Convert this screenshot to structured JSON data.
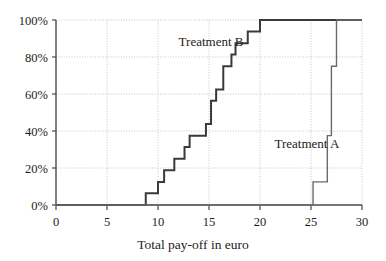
{
  "chart_data": {
    "type": "line",
    "subtype": "empirical-cdf-step",
    "title": "",
    "xlabel": "Total pay-off in euro",
    "ylabel": "",
    "xlim": [
      0,
      30
    ],
    "ylim": [
      0,
      100
    ],
    "xticks": [
      0,
      5,
      10,
      15,
      20,
      25,
      30
    ],
    "xtick_labels": [
      "0",
      "5",
      "10",
      "15",
      "20",
      "25",
      "30"
    ],
    "yticks": [
      0,
      20,
      40,
      60,
      80,
      100
    ],
    "ytick_labels": [
      "0%",
      "20%",
      "40%",
      "60%",
      "80%",
      "100%"
    ],
    "grid": true,
    "grid_style": "dotted",
    "legend": "inline-annotations",
    "annotations": [
      {
        "text": "Treatment B",
        "x": 15.2,
        "y": 86
      },
      {
        "text": "Treatment A",
        "x": 24.6,
        "y": 31
      }
    ],
    "series": [
      {
        "name": "Treatment B",
        "color": "#3a3a3a",
        "line_width": 2.0,
        "steps": [
          {
            "x": 0.0,
            "y": 0
          },
          {
            "x": 8.8,
            "y": 0
          },
          {
            "x": 8.8,
            "y": 6.3
          },
          {
            "x": 10.0,
            "y": 6.3
          },
          {
            "x": 10.0,
            "y": 12.5
          },
          {
            "x": 10.6,
            "y": 12.5
          },
          {
            "x": 10.6,
            "y": 18.8
          },
          {
            "x": 11.6,
            "y": 18.8
          },
          {
            "x": 11.6,
            "y": 25.0
          },
          {
            "x": 12.6,
            "y": 25.0
          },
          {
            "x": 12.6,
            "y": 31.3
          },
          {
            "x": 13.1,
            "y": 31.3
          },
          {
            "x": 13.1,
            "y": 37.5
          },
          {
            "x": 14.7,
            "y": 37.5
          },
          {
            "x": 14.7,
            "y": 43.8
          },
          {
            "x": 15.2,
            "y": 43.8
          },
          {
            "x": 15.2,
            "y": 56.3
          },
          {
            "x": 15.7,
            "y": 56.3
          },
          {
            "x": 15.7,
            "y": 62.5
          },
          {
            "x": 16.4,
            "y": 62.5
          },
          {
            "x": 16.4,
            "y": 75.0
          },
          {
            "x": 17.2,
            "y": 75.0
          },
          {
            "x": 17.2,
            "y": 81.3
          },
          {
            "x": 17.6,
            "y": 81.3
          },
          {
            "x": 17.6,
            "y": 87.5
          },
          {
            "x": 18.8,
            "y": 87.5
          },
          {
            "x": 18.8,
            "y": 93.8
          },
          {
            "x": 20.0,
            "y": 93.8
          },
          {
            "x": 20.0,
            "y": 100
          },
          {
            "x": 30.0,
            "y": 100
          }
        ]
      },
      {
        "name": "Treatment A",
        "color": "#6a6a6a",
        "line_width": 1.4,
        "steps": [
          {
            "x": 0.0,
            "y": 0
          },
          {
            "x": 25.2,
            "y": 0
          },
          {
            "x": 25.2,
            "y": 12.5
          },
          {
            "x": 26.6,
            "y": 12.5
          },
          {
            "x": 26.6,
            "y": 37.5
          },
          {
            "x": 27.0,
            "y": 37.5
          },
          {
            "x": 27.0,
            "y": 75.0
          },
          {
            "x": 27.5,
            "y": 75.0
          },
          {
            "x": 27.5,
            "y": 100
          },
          {
            "x": 30.0,
            "y": 100
          }
        ]
      }
    ]
  },
  "colors": {
    "axis": "#4a4a4a",
    "grid": "#b8b8b8",
    "treatment_b": "#3a3a3a",
    "treatment_a": "#6a6a6a",
    "text": "#1c1c1c",
    "background": "#ffffff"
  }
}
